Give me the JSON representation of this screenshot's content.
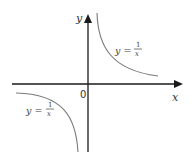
{
  "diagram": {
    "axes": {
      "x_label": "x",
      "y_label": "y",
      "origin_label": "0"
    },
    "curves": [
      {
        "name": "first-quadrant-branch",
        "label_lhs": "y =",
        "label_num": "1",
        "label_den": "x"
      },
      {
        "name": "third-quadrant-branch",
        "label_lhs": "y =",
        "label_num": "1",
        "label_den": "x"
      }
    ],
    "colors": {
      "axis": "#1a1a1a",
      "curve": "#7a7a7a",
      "text": "#333333"
    }
  }
}
